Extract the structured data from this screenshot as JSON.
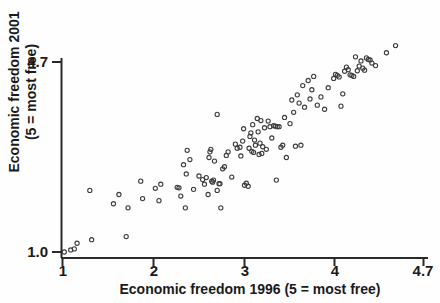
{
  "chart_data": {
    "type": "scatter",
    "title": "",
    "xlabel": "Economic freedom 1996 (5 = most free)",
    "ylabel_line1": "Economic freedom 2001",
    "ylabel_line2": "(5 = most free)",
    "ylabel": "Economic freedom 2001 (5 = most free)",
    "xlim": [
      1,
      4.7
    ],
    "ylim": [
      1.0,
      4.7
    ],
    "xticks": [
      1,
      2,
      3,
      4,
      4.7
    ],
    "xtick_labels": [
      "1",
      "2",
      "3",
      "4",
      "4.7"
    ],
    "yticks": [
      1.0,
      4.7
    ],
    "ytick_labels": [
      "1.0",
      "4.7"
    ],
    "grid": false,
    "legend": null,
    "marker": "open-circle",
    "marker_color": "#3c3c3c",
    "axis_color": "#2a2a2a",
    "points": [
      [
        1.02,
        1.0
      ],
      [
        1.09,
        1.04
      ],
      [
        1.13,
        1.06
      ],
      [
        1.16,
        1.17
      ],
      [
        1.32,
        1.24
      ],
      [
        1.3,
        2.2
      ],
      [
        1.56,
        1.94
      ],
      [
        1.62,
        2.12
      ],
      [
        1.7,
        1.3
      ],
      [
        1.72,
        1.86
      ],
      [
        1.86,
        2.38
      ],
      [
        1.88,
        2.04
      ],
      [
        2.02,
        2.24
      ],
      [
        2.06,
        2.0
      ],
      [
        2.08,
        2.32
      ],
      [
        2.26,
        2.26
      ],
      [
        2.28,
        2.25
      ],
      [
        2.3,
        2.09
      ],
      [
        2.33,
        2.7
      ],
      [
        2.35,
        1.86
      ],
      [
        2.36,
        2.52
      ],
      [
        2.37,
        2.98
      ],
      [
        2.4,
        2.8
      ],
      [
        2.44,
        2.22
      ],
      [
        2.5,
        2.48
      ],
      [
        2.54,
        2.41
      ],
      [
        2.56,
        2.32
      ],
      [
        2.58,
        2.45
      ],
      [
        2.6,
        2.12
      ],
      [
        2.61,
        2.84
      ],
      [
        2.62,
        2.95
      ],
      [
        2.63,
        3.0
      ],
      [
        2.64,
        2.38
      ],
      [
        2.65,
        2.36
      ],
      [
        2.66,
        2.4
      ],
      [
        2.67,
        2.77
      ],
      [
        2.7,
        3.68
      ],
      [
        2.7,
        2.2
      ],
      [
        2.72,
        2.33
      ],
      [
        2.73,
        2.33
      ],
      [
        2.74,
        1.86
      ],
      [
        2.76,
        2.62
      ],
      [
        2.78,
        2.66
      ],
      [
        2.8,
        2.88
      ],
      [
        2.82,
        2.95
      ],
      [
        2.86,
        2.46
      ],
      [
        2.9,
        3.1
      ],
      [
        2.92,
        3.02
      ],
      [
        2.95,
        3.04
      ],
      [
        2.96,
        2.87
      ],
      [
        2.98,
        3.16
      ],
      [
        2.99,
        3.4
      ],
      [
        3.0,
        2.3
      ],
      [
        3.02,
        2.34
      ],
      [
        3.04,
        2.28
      ],
      [
        3.05,
        3.02
      ],
      [
        3.06,
        3.25
      ],
      [
        3.07,
        3.32
      ],
      [
        3.08,
        2.96
      ],
      [
        3.09,
        3.48
      ],
      [
        3.1,
        2.94
      ],
      [
        3.11,
        3.18
      ],
      [
        3.12,
        3.08
      ],
      [
        3.14,
        3.6
      ],
      [
        3.15,
        3.34
      ],
      [
        3.16,
        2.9
      ],
      [
        3.17,
        3.12
      ],
      [
        3.18,
        3.56
      ],
      [
        3.19,
        2.92
      ],
      [
        3.2,
        3.05
      ],
      [
        3.22,
        3.42
      ],
      [
        3.24,
        3.0
      ],
      [
        3.26,
        3.55
      ],
      [
        3.28,
        3.44
      ],
      [
        3.3,
        3.22
      ],
      [
        3.32,
        3.46
      ],
      [
        3.34,
        3.45
      ],
      [
        3.35,
        2.4
      ],
      [
        3.36,
        3.44
      ],
      [
        3.38,
        3.44
      ],
      [
        3.4,
        3.04
      ],
      [
        3.42,
        3.08
      ],
      [
        3.44,
        3.62
      ],
      [
        3.46,
        2.84
      ],
      [
        3.5,
        3.5
      ],
      [
        3.52,
        3.96
      ],
      [
        3.54,
        3.72
      ],
      [
        3.56,
        3.06
      ],
      [
        3.58,
        4.06
      ],
      [
        3.6,
        3.9
      ],
      [
        3.62,
        3.08
      ],
      [
        3.64,
        4.24
      ],
      [
        3.66,
        3.82
      ],
      [
        3.7,
        4.34
      ],
      [
        3.72,
        3.98
      ],
      [
        3.74,
        4.16
      ],
      [
        3.76,
        4.42
      ],
      [
        3.8,
        3.86
      ],
      [
        3.84,
        4.02
      ],
      [
        3.88,
        3.78
      ],
      [
        3.92,
        4.2
      ],
      [
        3.98,
        4.38
      ],
      [
        4.0,
        4.46
      ],
      [
        4.02,
        4.44
      ],
      [
        4.04,
        4.41
      ],
      [
        4.06,
        3.84
      ],
      [
        4.08,
        4.08
      ],
      [
        4.1,
        4.52
      ],
      [
        4.12,
        4.6
      ],
      [
        4.14,
        4.55
      ],
      [
        4.16,
        4.45
      ],
      [
        4.18,
        4.44
      ],
      [
        4.2,
        4.42
      ],
      [
        4.22,
        4.8
      ],
      [
        4.24,
        4.53
      ],
      [
        4.26,
        4.62
      ],
      [
        4.28,
        4.72
      ],
      [
        4.3,
        4.58
      ],
      [
        4.32,
        4.54
      ],
      [
        4.34,
        4.78
      ],
      [
        4.36,
        4.75
      ],
      [
        4.38,
        4.74
      ],
      [
        4.4,
        4.68
      ],
      [
        4.44,
        4.63
      ],
      [
        4.56,
        4.88
      ],
      [
        4.66,
        5.02
      ]
    ]
  }
}
